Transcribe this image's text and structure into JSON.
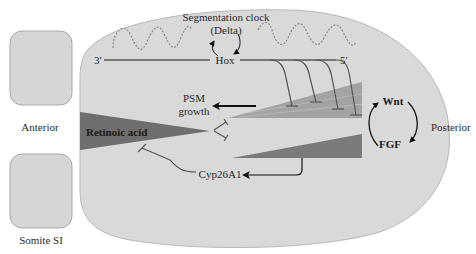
{
  "figure": {
    "labels": {
      "segmentation_clock_line1": "Segmentation clock",
      "segmentation_clock_line2": "(Delta)",
      "hox": "Hox",
      "three_prime": "3′",
      "five_prime": "5′",
      "psm_line1": "PSM",
      "psm_line2": "growth",
      "retinoic_acid": "Retinoic acid",
      "cyp26a1": "Cyp26A1",
      "wnt": "Wnt",
      "fgf": "FGF",
      "anterior": "Anterior",
      "posterior": "Posterior",
      "somite": "Somite SI"
    },
    "colors": {
      "background": "#ffffff",
      "psm_body_fill": "#d9d9d9",
      "psm_body_stroke": "#b8b8b8",
      "somite_fill": "#d6d6d6",
      "somite_stroke": "#a8a8a8",
      "retinoic_acid_gradient": "#6e6e6e",
      "wnt_gradient": "#a3a3a3",
      "fgf_gradient": "#7a7a7a",
      "line": "#555555",
      "arrow": "#111111",
      "clock_wave": "#8a8a8a"
    },
    "hox_inhibition_count": 4
  }
}
